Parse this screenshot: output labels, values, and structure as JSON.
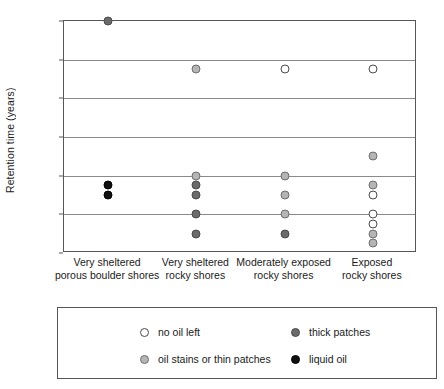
{
  "chart_data": {
    "type": "scatter",
    "title": "",
    "xlabel": "",
    "ylabel": "Retention time (years)",
    "ylim": [
      0,
      12
    ],
    "yticks": [
      0,
      2,
      4,
      6,
      8,
      10,
      12
    ],
    "grid": "horizontal",
    "legend_position": "bottom",
    "categories": [
      "Very sheltered\nporous boulder shores",
      "Very sheltered\nrocky shores",
      "Moderately exposed\nrocky shores",
      "Exposed\nrocky shores"
    ],
    "series": [
      {
        "name": "no oil left",
        "key": "none",
        "color": "#ffffff",
        "edge": "#4a4a4a"
      },
      {
        "name": "oil stains or thin patches",
        "key": "stain",
        "color": "#b5b5b5",
        "edge": "#6e6e6e"
      },
      {
        "name": "thick patches",
        "key": "thick",
        "color": "#6b6b6b",
        "edge": "#4a4a4a"
      },
      {
        "name": "liquid oil",
        "key": "liquid",
        "color": "#111111",
        "edge": "#000000"
      }
    ],
    "points": [
      {
        "category": 0,
        "y": 12.0,
        "type": "thick"
      },
      {
        "category": 0,
        "y": 3.5,
        "type": "liquid"
      },
      {
        "category": 0,
        "y": 3.0,
        "type": "liquid"
      },
      {
        "category": 1,
        "y": 9.5,
        "type": "stain"
      },
      {
        "category": 1,
        "y": 4.0,
        "type": "stain"
      },
      {
        "category": 1,
        "y": 3.5,
        "type": "thick"
      },
      {
        "category": 1,
        "y": 3.0,
        "type": "thick"
      },
      {
        "category": 1,
        "y": 2.0,
        "type": "thick"
      },
      {
        "category": 1,
        "y": 1.0,
        "type": "thick"
      },
      {
        "category": 2,
        "y": 9.5,
        "type": "none"
      },
      {
        "category": 2,
        "y": 4.0,
        "type": "stain"
      },
      {
        "category": 2,
        "y": 3.0,
        "type": "stain"
      },
      {
        "category": 2,
        "y": 2.0,
        "type": "stain"
      },
      {
        "category": 2,
        "y": 1.0,
        "type": "thick"
      },
      {
        "category": 3,
        "y": 9.5,
        "type": "none"
      },
      {
        "category": 3,
        "y": 5.0,
        "type": "stain"
      },
      {
        "category": 3,
        "y": 3.5,
        "type": "stain"
      },
      {
        "category": 3,
        "y": 3.0,
        "type": "none"
      },
      {
        "category": 3,
        "y": 2.0,
        "type": "none"
      },
      {
        "category": 3,
        "y": 1.5,
        "type": "none"
      },
      {
        "category": 3,
        "y": 1.0,
        "type": "stain"
      },
      {
        "category": 3,
        "y": 0.5,
        "type": "stain"
      }
    ]
  },
  "legend": {
    "entries": [
      {
        "label": "no oil left",
        "type": "none"
      },
      {
        "label": "thick patches",
        "type": "thick"
      },
      {
        "label": "oil stains or thin patches",
        "type": "stain"
      },
      {
        "label": "liquid oil",
        "type": "liquid"
      }
    ]
  }
}
